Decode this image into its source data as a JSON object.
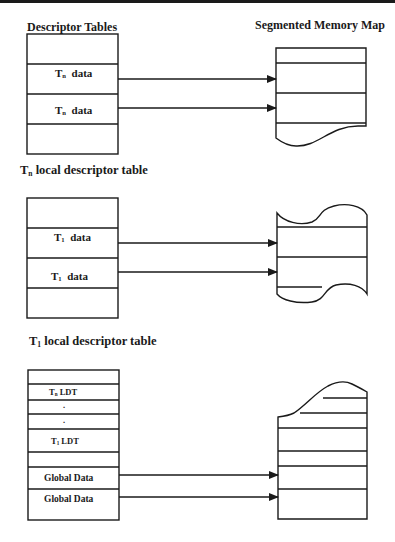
{
  "figure": {
    "left_title": "Descriptor Tables",
    "right_title": "Segmented Memory Map",
    "panels": [
      {
        "id": "gdt-top",
        "rows": [
          "",
          "Tn data",
          "Tn data",
          ""
        ],
        "caption_prefix": "T",
        "caption_sub": "n",
        "caption_rest": " local descriptor table",
        "arrows": [
          "Tn data row 1 → memory segment 2",
          "Tn data row 2 → memory segment 3"
        ]
      },
      {
        "id": "ldt-t1",
        "rows": [
          "",
          "T1 data",
          "T1 data",
          ""
        ],
        "caption_prefix": "T",
        "caption_sub": "1",
        "caption_rest": "  local descriptor table",
        "arrows": [
          "T1 data row 1 → memory segment 2",
          "T1 data row 2 → memory segment 3"
        ]
      },
      {
        "id": "gdt",
        "rows": [
          "",
          "Tn LDT",
          ".",
          ".",
          "T1 LDT",
          "",
          "Global Data",
          "Global Data"
        ],
        "arrows": [
          "Global Data row 1 → memory segment 5",
          "Global Data row 2 → memory segment 6"
        ]
      }
    ],
    "labels": {
      "tn": "T",
      "tn_sub": "n",
      "t1": "T",
      "t1_sub": "1",
      "data": "data",
      "ldt": "LDT",
      "dot": ".",
      "global_data": "Global Data"
    },
    "colors": {
      "line": "#1a1a1a",
      "background": "#ffffff"
    }
  }
}
